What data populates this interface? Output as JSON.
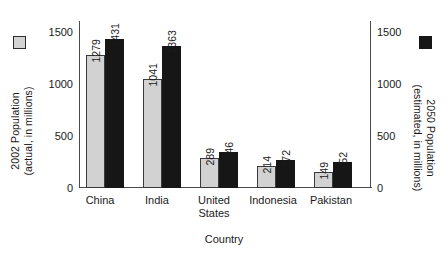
{
  "chart_data": {
    "type": "bar",
    "title": "",
    "subtitle": "",
    "xlabel": "Country",
    "ylabel": "2002 Population (actual, in millions)",
    "y2label": "2050 Population (estimated, in millions)",
    "categories": [
      "China",
      "India",
      "United States",
      "Indonesia",
      "Pakistan"
    ],
    "series": [
      {
        "name": "2002 Population (actual, in millions)",
        "color": "#d2d2d2",
        "values": [
          1279,
          1041,
          289,
          214,
          149
        ]
      },
      {
        "name": "2050 Population (estimated, in millions)",
        "color": "#161616",
        "values": [
          1431,
          1363,
          346,
          272,
          252
        ]
      }
    ],
    "ylim": [
      0,
      1600
    ],
    "y2lim": [
      0,
      1600
    ],
    "yticks": [
      0,
      500,
      1000,
      1500
    ],
    "y2ticks": [
      0,
      500,
      1000,
      1500
    ],
    "grid": false,
    "legend_position": "outside-left-and-right",
    "value_labels_shown": true,
    "value_labels_rotation": "vertical"
  },
  "axes": {
    "left": {
      "title_lines": [
        "2002 Population",
        "(actual, in millions)"
      ],
      "tick_labels": [
        "1500",
        "1000",
        "500",
        "0"
      ]
    },
    "right": {
      "title_lines": [
        "2050 Population",
        "(estimated, in millions)"
      ],
      "tick_labels": [
        "1500",
        "1000",
        "500",
        "0"
      ]
    },
    "bottom": {
      "title": "Country",
      "tick_labels": [
        "China",
        "India",
        "United\nStates",
        "Indonesia",
        "Pakistan"
      ]
    }
  },
  "legend": {
    "left_swatch_color": "#d2d2d2",
    "right_swatch_color": "#161616"
  },
  "value_labels": {
    "china_2002": "1279",
    "china_2050": "1431",
    "india_2002": "1041",
    "india_2050": "1363",
    "us_2002": "289",
    "us_2050": "346",
    "indonesia_2002": "214",
    "indonesia_2050": "272",
    "pakistan_2002": "149",
    "pakistan_2050": "252"
  }
}
